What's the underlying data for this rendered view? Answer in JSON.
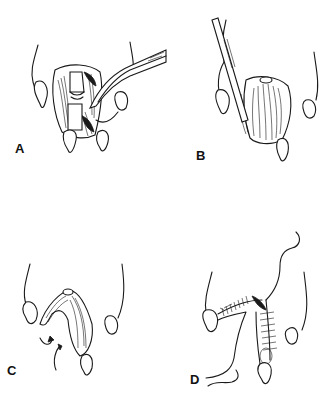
{
  "figure": {
    "panels": [
      {
        "id": "A",
        "label": "A",
        "description": "Opened digit with exposed phalangeal bones, curved retractor/forceps inserted from upper right"
      },
      {
        "id": "B",
        "label": "B",
        "description": "Scalpel blade incising through layered tissue of digit"
      },
      {
        "id": "C",
        "label": "C",
        "description": "Flap of tissue folded into V shape with curved arrows indicating rotation"
      },
      {
        "id": "D",
        "label": "D",
        "description": "Closed incision with interrupted sutures along the digit and a free suture strand"
      }
    ],
    "colors": {
      "ink": "#1a1a1a",
      "background": "#ffffff"
    }
  }
}
